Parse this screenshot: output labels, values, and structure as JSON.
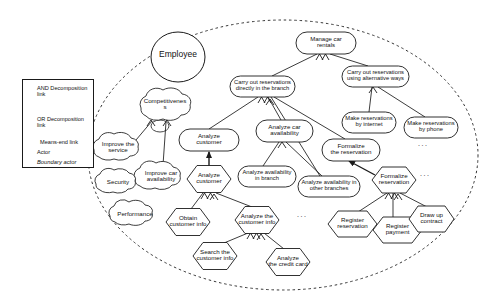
{
  "diagram": {
    "notation": "i-star / Tropos goal model",
    "boundary_actor": "Employee"
  },
  "actor": {
    "name": "Employee",
    "shape": "circle",
    "cx": 178,
    "cy": 57,
    "rx": 27,
    "ry": 25
  },
  "legend": {
    "x": 22,
    "y": 79,
    "width": 72,
    "height": 89,
    "items": [
      {
        "icon": "and-decomposition-icon",
        "label": "AND Decomposition\nlink"
      },
      {
        "icon": "or-decomposition-icon",
        "label": "OR Decomposition\nlink"
      },
      {
        "icon": "means-end-arrow-icon",
        "label": "Means-end link"
      },
      {
        "icon": "actor-circle-icon",
        "label": "Actor"
      },
      {
        "icon": "boundary-actor-circle-icon",
        "label": "Boundary actor"
      }
    ]
  },
  "softgoals": [
    {
      "id": "competitiveness",
      "label": "Competitivenes\ns",
      "cx": 165,
      "cy": 107,
      "rx": 32,
      "ry": 15,
      "font": 6.2
    },
    {
      "id": "improve-the-service",
      "label": "Improve the\nservice",
      "cx": 118,
      "cy": 148,
      "rx": 27,
      "ry": 14,
      "font": 6.2
    },
    {
      "id": "improve-car-availability",
      "label": "Improve car\navailability",
      "cx": 161,
      "cy": 177,
      "rx": 28,
      "ry": 14,
      "font": 6.2
    },
    {
      "id": "security",
      "label": "Security",
      "cx": 118,
      "cy": 182,
      "rx": 24,
      "ry": 13,
      "font": 6.2
    },
    {
      "id": "performance",
      "label": "Performance",
      "cx": 135,
      "cy": 214,
      "rx": 27,
      "ry": 13,
      "font": 6.2
    }
  ],
  "goals": [
    {
      "id": "manage-car-rentals",
      "label": "Manage car\nrentals",
      "x": 296,
      "y": 32,
      "w": 60,
      "h": 22,
      "font": 6.0
    },
    {
      "id": "carry-out-reservations-branch",
      "label": "Carry out reservations\ndirectly in the branch",
      "x": 230,
      "y": 76,
      "w": 65,
      "h": 21,
      "font": 5.8
    },
    {
      "id": "carry-out-reservations-alternative",
      "label": "Carry out reservations\nusing alternative ways",
      "x": 342,
      "y": 66,
      "w": 67,
      "h": 21,
      "font": 5.8
    },
    {
      "id": "make-reservations-internet",
      "label": "Make reservations\nby internet",
      "x": 342,
      "y": 112,
      "w": 54,
      "h": 21,
      "font": 5.8
    },
    {
      "id": "make-reservations-phone",
      "label": "Make reservations\nby phone",
      "x": 404,
      "y": 117,
      "w": 54,
      "h": 21,
      "font": 5.8
    },
    {
      "id": "analyze-customer-goal",
      "label": "Analyze\ncustomer",
      "x": 179,
      "y": 129,
      "w": 60,
      "h": 22,
      "font": 6.2
    },
    {
      "id": "analyze-car-availability",
      "label": "Analyze car\navailability",
      "x": 256,
      "y": 120,
      "w": 57,
      "h": 22,
      "font": 6.2
    },
    {
      "id": "formalize-the-reservation",
      "label": "Formalize\nthe reservation",
      "x": 322,
      "y": 139,
      "w": 58,
      "h": 22,
      "font": 6.2
    },
    {
      "id": "analyze-availability-in-branch",
      "label": "Analyze availability\nin branch",
      "x": 238,
      "y": 166,
      "w": 58,
      "h": 21,
      "font": 5.8
    },
    {
      "id": "analyze-availability-other-branches",
      "label": "Analyze availability in\nother branches",
      "x": 298,
      "y": 176,
      "w": 62,
      "h": 21,
      "font": 5.8
    }
  ],
  "tasks": [
    {
      "id": "analyze-customer-task",
      "label": "Analyze\ncustomer",
      "cx": 209,
      "cy": 179,
      "w": 62,
      "h": 27,
      "font": 6.2
    },
    {
      "id": "formalize-reservation-task",
      "label": "Formalize\nreservation",
      "cx": 394,
      "cy": 180,
      "w": 62,
      "h": 26,
      "font": 6.2
    },
    {
      "id": "obtain-customer-info",
      "label": "Obtain\ncustomer info",
      "cx": 188,
      "cy": 222,
      "w": 62,
      "h": 27,
      "font": 6.2
    },
    {
      "id": "analyze-the-customer-info",
      "label": "Analyze the\ncustomer info",
      "cx": 257,
      "cy": 220,
      "w": 62,
      "h": 27,
      "font": 6.2
    },
    {
      "id": "search-the-customer-info",
      "label": "Search the\ncustomer info",
      "cx": 215,
      "cy": 256,
      "w": 62,
      "h": 27,
      "font": 6.2
    },
    {
      "id": "analyze-the-credit-card",
      "label": "Analyze\nthe credit card",
      "cx": 288,
      "cy": 262,
      "w": 62,
      "h": 27,
      "font": 6.2
    },
    {
      "id": "register-reservation",
      "label": "Register\nreservation",
      "cx": 348,
      "cy": 224,
      "w": 58,
      "h": 26,
      "font": 6.2
    },
    {
      "id": "register-payment",
      "label": "Register\npayment",
      "cx": 393,
      "cy": 230,
      "w": 57,
      "h": 26,
      "font": 6.2
    },
    {
      "id": "draw-up-contract",
      "label": "Draw up\ncontract",
      "cx": 432,
      "cy": 219,
      "w": 52,
      "h": 26,
      "font": 6.2
    }
  ],
  "ellipses_marks": [
    {
      "id": "ellipsis-phone",
      "x": 418,
      "y": 143,
      "text": "..."
    },
    {
      "id": "ellipsis-formalize",
      "x": 420,
      "y": 173,
      "text": "..."
    },
    {
      "id": "ellipsis-customer-info",
      "x": 297,
      "y": 214,
      "text": "..."
    }
  ],
  "colors": {
    "stroke": "#1a1a1a",
    "text": "#111111",
    "background": "#ffffff",
    "boundary": "#333333"
  }
}
